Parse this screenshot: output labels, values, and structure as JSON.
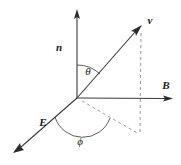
{
  "figure": {
    "background_color": "#ffffff",
    "line_color": "#3a3a3a",
    "dash_color": "#8d8d8d",
    "text_color": "#1a1a1a",
    "width": 181,
    "height": 165
  },
  "labels": {
    "n": "n",
    "v": "v",
    "B": "B",
    "E": "E",
    "theta": "θ",
    "phi": "ϕ"
  },
  "geometry": {
    "origin": {
      "x": 77,
      "y": 98
    },
    "axes": [
      {
        "name": "n",
        "tip_x": 77,
        "tip_y": 10,
        "arrow": true,
        "style": "solid"
      },
      {
        "name": "B",
        "tip_x": 172,
        "tip_y": 98,
        "arrow": true,
        "style": "solid"
      },
      {
        "name": "E",
        "tip_x": 14,
        "tip_y": 152,
        "arrow": true,
        "style": "solid"
      },
      {
        "name": "v",
        "tip_x": 142,
        "tip_y": 27,
        "arrow": true,
        "style": "solid"
      }
    ],
    "projections": [
      {
        "name": "v-vertical-drop",
        "from_x": 142,
        "from_y": 27,
        "to_x": 140,
        "to_y": 134,
        "style": "dashed"
      },
      {
        "name": "v-ground-projection",
        "from_x": 77,
        "from_y": 98,
        "to_x": 140,
        "to_y": 134,
        "style": "dashed"
      }
    ],
    "angles": [
      {
        "name": "theta",
        "between": "n and v",
        "label_x": 86,
        "label_y": 71
      },
      {
        "name": "phi",
        "between": "E and v-ground-projection",
        "label_x": 78,
        "label_y": 140
      }
    ]
  }
}
